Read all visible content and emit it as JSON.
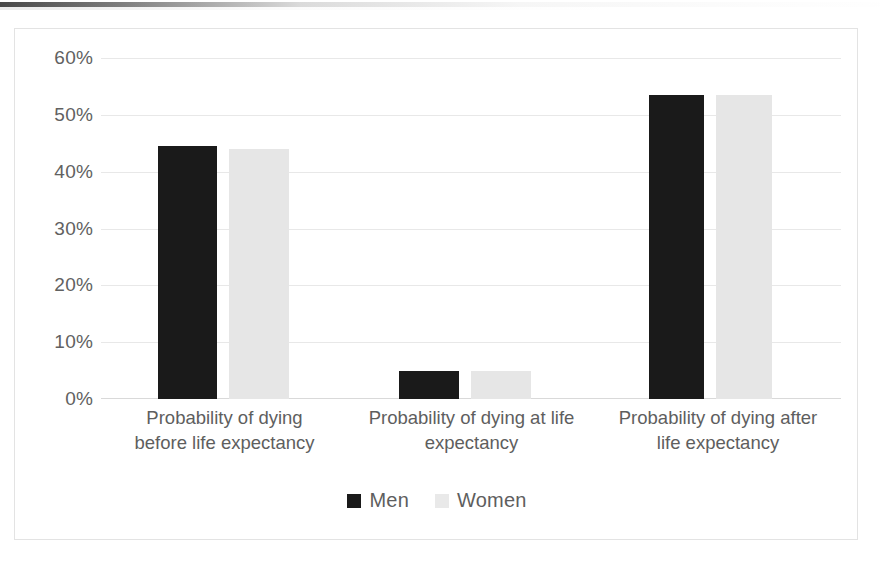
{
  "chart_data": {
    "type": "bar",
    "title": "",
    "subtitle": "",
    "xlabel": "",
    "ylabel": "",
    "ylim": [
      0,
      60
    ],
    "ytick_labels": [
      "60%",
      "50%",
      "40%",
      "30%",
      "20%",
      "10%",
      "0%"
    ],
    "ytick_values": [
      60,
      50,
      40,
      30,
      20,
      10,
      0
    ],
    "grid": true,
    "legend_position": "bottom-center",
    "categories": [
      "Probability of dying before life expectancy",
      "Probability of dying at life expectancy",
      "Probability of dying after life expectancy"
    ],
    "series": [
      {
        "name": "Men",
        "color": "#1a1a1a",
        "values": [
          44.5,
          5.0,
          53.5
        ]
      },
      {
        "name": "Women",
        "color": "#e6e6e6",
        "values": [
          44.0,
          5.0,
          53.5
        ]
      }
    ]
  },
  "legend": {
    "items": [
      {
        "label": "Men",
        "color": "#1a1a1a"
      },
      {
        "label": "Women",
        "color": "#e9e9e9"
      }
    ]
  },
  "category_lines": [
    [
      "Probability of dying",
      "before life expectancy"
    ],
    [
      "Probability of dying at life",
      "expectancy"
    ],
    [
      "Probability of dying after",
      "life expectancy"
    ]
  ],
  "colors": {
    "men": "#1a1a1a",
    "women": "#e6e6e6",
    "gridline": "#e8e8e8",
    "frame": "#e3e3e3",
    "text": "#5e5e5e"
  }
}
